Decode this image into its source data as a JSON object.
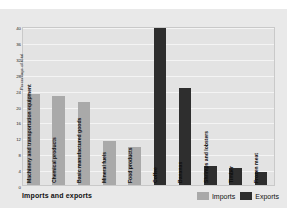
{
  "footer": {
    "title": "Imports and exports"
  },
  "legend": {
    "position": "bottom-right",
    "entries": [
      {
        "label": "Imports",
        "color": "#a9a9a9"
      },
      {
        "label": "Exports",
        "color": "#2e2e2e"
      }
    ]
  },
  "colors": {
    "imports": "#a9a9a9",
    "exports": "#2e2e2e",
    "figure_background": "#e9e9e9",
    "plot_background": "#e3e3e3",
    "gridline": "#f4f4f4",
    "text": "#111111"
  },
  "chart_data": {
    "type": "bar",
    "title": "Imports and exports",
    "xlabel": "",
    "ylabel": "Percentage of total",
    "ylim": [
      0,
      40
    ],
    "yticks": [
      0,
      4,
      8,
      12,
      16,
      20,
      24,
      28,
      32,
      36,
      40
    ],
    "ytick_labels": [
      "0",
      "4",
      "8",
      "12",
      "16",
      "20",
      "24",
      "28",
      "32",
      "36",
      "40"
    ],
    "grid": true,
    "legend_position": "bottom-right",
    "categories": [
      "Machinery and transportation equipment",
      "Chemical products",
      "Basic manufactured goods",
      "Mineral fuels",
      "Food products",
      "Coffee",
      "Bananas",
      "Shrimps and lobsters",
      "Timber",
      "Frozen meat"
    ],
    "series": [
      {
        "name": "Imports",
        "color": "#a9a9a9",
        "values": [
          23,
          22.5,
          21,
          11,
          9.5,
          null,
          null,
          null,
          null,
          null
        ]
      },
      {
        "name": "Exports",
        "color": "#2e2e2e",
        "values": [
          null,
          null,
          null,
          null,
          null,
          39.5,
          24.5,
          4.7,
          4.2,
          3.2
        ]
      }
    ],
    "bars": [
      {
        "label": "Machinery and transportation equipment",
        "value": 23,
        "series": "Imports"
      },
      {
        "label": "Chemical products",
        "value": 22.5,
        "series": "Imports"
      },
      {
        "label": "Basic manufactured goods",
        "value": 21,
        "series": "Imports"
      },
      {
        "label": "Mineral fuels",
        "value": 11,
        "series": "Imports"
      },
      {
        "label": "Food products",
        "value": 9.5,
        "series": "Imports"
      },
      {
        "label": "Coffee",
        "value": 39.5,
        "series": "Exports"
      },
      {
        "label": "Bananas",
        "value": 24.5,
        "series": "Exports"
      },
      {
        "label": "Shrimps and lobsters",
        "value": 4.7,
        "series": "Exports"
      },
      {
        "label": "Timber",
        "value": 4.2,
        "series": "Exports"
      },
      {
        "label": "Frozen meat",
        "value": 3.2,
        "series": "Exports"
      }
    ]
  }
}
